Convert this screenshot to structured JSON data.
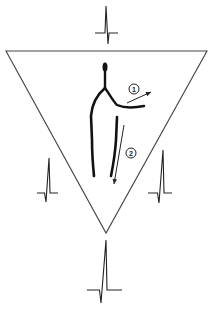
{
  "canvas": {
    "width": 213,
    "height": 312,
    "background": "#ffffff"
  },
  "colors": {
    "line": "#222222",
    "figure": "#111111",
    "triangle": "#444444"
  },
  "triangle": {
    "name": "einthoven-triangle",
    "vertices": [
      [
        6,
        51
      ],
      [
        207,
        51
      ],
      [
        106,
        233
      ]
    ]
  },
  "ecg_complexes": [
    {
      "name": "ecg-top",
      "position": "top",
      "baseline_y": 33,
      "x_start": 95,
      "x_end": 118,
      "r_x": 106,
      "r_peak_y": 6,
      "s_x": 108,
      "s_trough_y": 44
    },
    {
      "name": "ecg-left",
      "position": "left",
      "baseline_y": 193,
      "x_start": 37,
      "x_end": 58,
      "r_x": 49,
      "r_peak_y": 158,
      "s_x": 46,
      "s_trough_y": 202
    },
    {
      "name": "ecg-right",
      "position": "right",
      "baseline_y": 193,
      "x_start": 148,
      "x_end": 172,
      "r_x": 163,
      "r_peak_y": 150,
      "s_x": 159,
      "s_trough_y": 203
    },
    {
      "name": "ecg-bottom",
      "position": "bottom",
      "baseline_y": 290,
      "x_start": 87,
      "x_end": 122,
      "r_x": 106,
      "r_peak_y": 240,
      "s_x": 101,
      "s_trough_y": 303
    }
  ],
  "figure": {
    "name": "vector-figure",
    "head": {
      "cx": 105,
      "cy": 67,
      "rx": 2.5,
      "ry": 4.5
    },
    "stem": {
      "x": 105,
      "y1": 68,
      "y2": 88
    }
  },
  "vectors": [
    {
      "label": "1",
      "circle": {
        "cx": 134,
        "cy": 89,
        "r": 5
      },
      "from": [
        127,
        103
      ],
      "to": [
        151,
        92
      ]
    },
    {
      "label": "2",
      "circle": {
        "cx": 131,
        "cy": 153,
        "r": 5
      },
      "from": [
        124,
        125
      ],
      "to": [
        114,
        184
      ]
    }
  ]
}
